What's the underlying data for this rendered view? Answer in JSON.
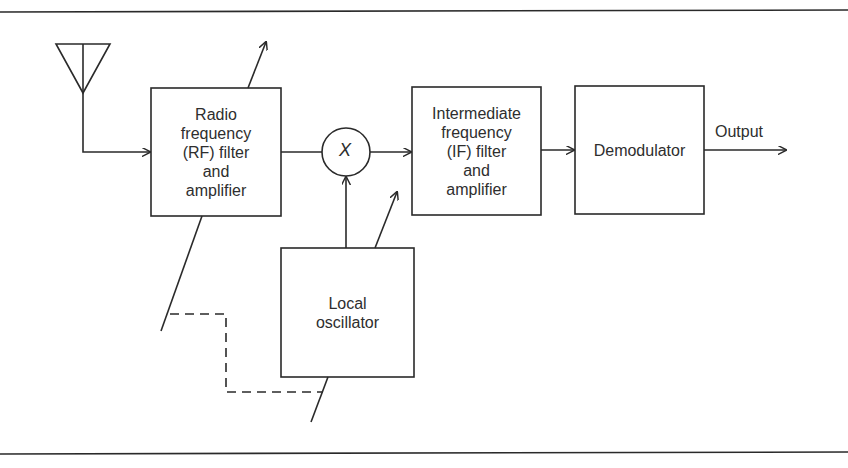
{
  "diagram": {
    "type": "block-diagram",
    "colors": {
      "line": "#2a2a2a",
      "background": "#ffffff"
    },
    "blocks": {
      "rf": {
        "lines": [
          "Radio",
          "frequency",
          "(RF) filter",
          "and",
          "amplifier"
        ]
      },
      "mixer": {
        "label": "X"
      },
      "if": {
        "lines": [
          "Intermediate",
          "frequency",
          "(IF) filter",
          "and",
          "amplifier"
        ]
      },
      "demod": {
        "lines": [
          "Demodulator"
        ]
      },
      "lo": {
        "lines": [
          "Local",
          "oscillator"
        ]
      }
    },
    "output_label": "Output",
    "icons": {
      "antenna": "antenna-icon",
      "mixer": "multiplier-circle-icon",
      "tuning": "variable-tuning-arrow-icon"
    },
    "connections": [
      {
        "from": "antenna",
        "to": "rf"
      },
      {
        "from": "rf",
        "to": "mixer"
      },
      {
        "from": "lo",
        "to": "mixer"
      },
      {
        "from": "mixer",
        "to": "if"
      },
      {
        "from": "if",
        "to": "demod"
      },
      {
        "from": "demod",
        "to": "output"
      },
      {
        "from": "rf-tuning",
        "to": "lo-tuning",
        "style": "dashed",
        "meaning": "ganged tuning"
      }
    ]
  }
}
